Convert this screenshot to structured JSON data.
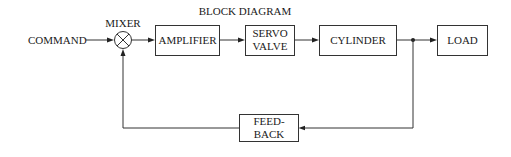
{
  "diagram": {
    "title": "BLOCK DIAGRAM",
    "input_label": "COMMAND",
    "mixer_label": "MIXER",
    "blocks": {
      "amplifier": {
        "lines": [
          "AMPLIFIER"
        ]
      },
      "servo_valve": {
        "lines": [
          "SERVO",
          "VALVE"
        ]
      },
      "cylinder": {
        "lines": [
          "CYLINDER"
        ]
      },
      "load": {
        "lines": [
          "LOAD"
        ]
      },
      "feedback": {
        "lines": [
          "FEED-",
          "BACK"
        ]
      }
    },
    "connections": [
      {
        "from": "command",
        "to": "mixer"
      },
      {
        "from": "mixer",
        "to": "amplifier"
      },
      {
        "from": "amplifier",
        "to": "servo_valve"
      },
      {
        "from": "servo_valve",
        "to": "cylinder"
      },
      {
        "from": "cylinder",
        "to": "load"
      },
      {
        "from": "cylinder_output_junction",
        "to": "feedback"
      },
      {
        "from": "feedback",
        "to": "mixer"
      }
    ]
  }
}
